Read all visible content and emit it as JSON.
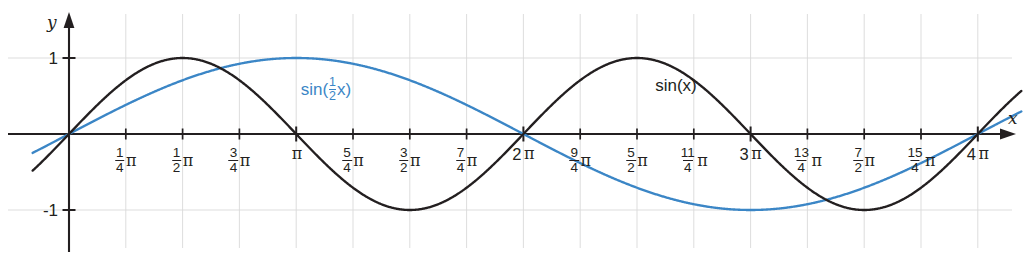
{
  "chart_data": {
    "type": "line",
    "title": "",
    "xlabel": "x",
    "ylabel": "y",
    "xlim": [
      -0.15,
      4.3
    ],
    "ylim": [
      -1.55,
      1.55
    ],
    "x_unit": "pi",
    "grid": true,
    "grid_x_step": 0.25,
    "grid_y_values": [
      1,
      -1
    ],
    "legend": "inline-annotations",
    "x_tick_labels": [
      {
        "value": 0.25,
        "num": "1",
        "den": "4",
        "symbol": "π"
      },
      {
        "value": 0.5,
        "num": "1",
        "den": "2",
        "symbol": "π"
      },
      {
        "value": 0.75,
        "num": "3",
        "den": "4",
        "symbol": "π"
      },
      {
        "value": 1.0,
        "int": "",
        "symbol": "π"
      },
      {
        "value": 1.25,
        "num": "5",
        "den": "4",
        "symbol": "π"
      },
      {
        "value": 1.5,
        "num": "3",
        "den": "2",
        "symbol": "π"
      },
      {
        "value": 1.75,
        "num": "7",
        "den": "4",
        "symbol": "π"
      },
      {
        "value": 2.0,
        "int": "2",
        "symbol": "π"
      },
      {
        "value": 2.25,
        "num": "9",
        "den": "4",
        "symbol": "π"
      },
      {
        "value": 2.5,
        "num": "5",
        "den": "2",
        "symbol": "π"
      },
      {
        "value": 2.75,
        "num": "11",
        "den": "4",
        "symbol": "π"
      },
      {
        "value": 3.0,
        "int": "3",
        "symbol": "π"
      },
      {
        "value": 3.25,
        "num": "13",
        "den": "4",
        "symbol": "π"
      },
      {
        "value": 3.5,
        "num": "7",
        "den": "2",
        "symbol": "π"
      },
      {
        "value": 3.75,
        "num": "15",
        "den": "4",
        "symbol": "π"
      },
      {
        "value": 4.0,
        "int": "4",
        "symbol": "π"
      }
    ],
    "y_tick_labels": [
      {
        "value": 1,
        "text": "1"
      },
      {
        "value": -1,
        "text": "-1"
      }
    ],
    "series": [
      {
        "name": "sin(x)",
        "label_parts": {
          "prefix": "sin(x)"
        },
        "color": "#231f20",
        "formula": "sin(x)",
        "period_pi": 2,
        "amplitude": 1,
        "zeros_pi": [
          0,
          1,
          2,
          3,
          4
        ],
        "maxima_pi": [
          0.5,
          2.5
        ],
        "minima_pi": [
          1.5,
          3.5
        ],
        "label_pos_pi": 2.58,
        "label_pos_y": 0.62
      },
      {
        "name": "sin(1/2 x)",
        "label_parts": {
          "prefix": "sin(",
          "num": "1",
          "den": "2",
          "suffix": "x)"
        },
        "color": "#3b86c6",
        "formula": "sin(x/2)",
        "period_pi": 4,
        "amplitude": 1,
        "zeros_pi": [
          0,
          2,
          4
        ],
        "maxima_pi": [
          1
        ],
        "minima_pi": [
          3
        ],
        "label_pos_pi": 1.02,
        "label_pos_y": 0.62
      }
    ]
  },
  "axes": {
    "y_axis_label": "y",
    "x_axis_label": "x"
  }
}
